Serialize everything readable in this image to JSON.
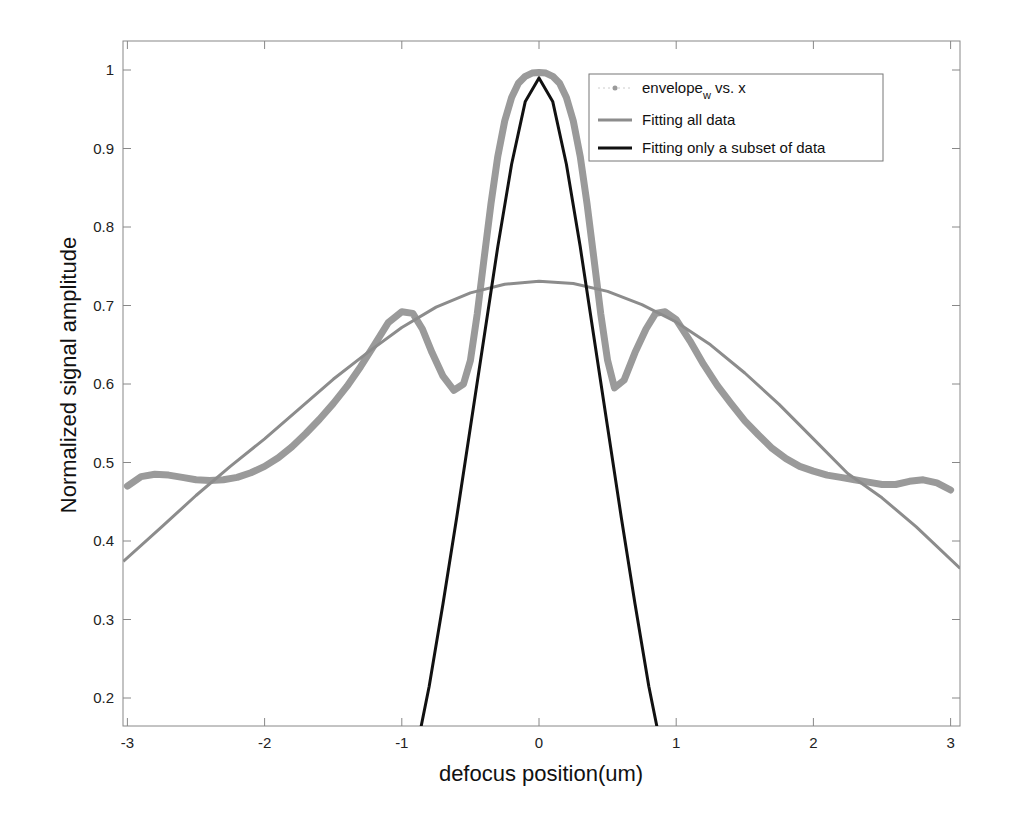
{
  "chart_data": {
    "type": "line",
    "title": "",
    "xlabel": "defocus position(um)",
    "ylabel": "Normalized signal amplitude",
    "xlim": [
      -3.03,
      3.07
    ],
    "ylim": [
      0.163,
      1.036
    ],
    "xticks": [
      -3,
      -2,
      -1,
      0,
      1,
      2,
      3
    ],
    "xtick_labels": [
      "-3",
      "-2",
      "-1",
      "0",
      "1",
      "2",
      "3"
    ],
    "yticks": [
      0.2,
      0.3,
      0.4,
      0.5,
      0.6,
      0.7,
      0.8,
      0.9,
      1
    ],
    "ytick_labels": [
      "0.2",
      "0.3",
      "0.4",
      "0.5",
      "0.6",
      "0.7",
      "0.8",
      "0.9",
      "1"
    ],
    "grid": false,
    "legend_position": "upper right",
    "legend": [
      {
        "label": "envelope",
        "subscript": "w",
        "suffix": " vs. x",
        "style": "dots",
        "color": "#9a9a9a"
      },
      {
        "label": "Fitting all data",
        "style": "line",
        "color": "#8c8c8c"
      },
      {
        "label": "Fitting only a subset of data",
        "style": "line",
        "color": "#111111"
      }
    ],
    "series": [
      {
        "name": "envelope_w vs. x",
        "color": "#9a9a9a",
        "x": [
          -3.0,
          -2.9,
          -2.8,
          -2.7,
          -2.6,
          -2.5,
          -2.4,
          -2.3,
          -2.2,
          -2.1,
          -2.0,
          -1.9,
          -1.8,
          -1.7,
          -1.6,
          -1.5,
          -1.4,
          -1.3,
          -1.2,
          -1.1,
          -1.0,
          -0.92,
          -0.85,
          -0.78,
          -0.7,
          -0.62,
          -0.55,
          -0.5,
          -0.45,
          -0.4,
          -0.35,
          -0.3,
          -0.25,
          -0.2,
          -0.15,
          -0.1,
          -0.05,
          0.0,
          0.05,
          0.1,
          0.15,
          0.2,
          0.25,
          0.3,
          0.35,
          0.4,
          0.45,
          0.5,
          0.55,
          0.62,
          0.7,
          0.78,
          0.85,
          0.92,
          1.0,
          1.1,
          1.2,
          1.3,
          1.4,
          1.5,
          1.6,
          1.7,
          1.8,
          1.9,
          2.0,
          2.1,
          2.2,
          2.3,
          2.4,
          2.5,
          2.6,
          2.7,
          2.8,
          2.9,
          3.0
        ],
        "y": [
          0.47,
          0.482,
          0.485,
          0.484,
          0.481,
          0.478,
          0.477,
          0.478,
          0.481,
          0.487,
          0.495,
          0.506,
          0.52,
          0.537,
          0.555,
          0.575,
          0.597,
          0.622,
          0.65,
          0.678,
          0.692,
          0.69,
          0.67,
          0.64,
          0.61,
          0.592,
          0.6,
          0.63,
          0.69,
          0.76,
          0.83,
          0.89,
          0.935,
          0.965,
          0.983,
          0.992,
          0.996,
          0.997,
          0.996,
          0.992,
          0.983,
          0.965,
          0.935,
          0.89,
          0.83,
          0.76,
          0.69,
          0.63,
          0.595,
          0.605,
          0.64,
          0.67,
          0.69,
          0.692,
          0.682,
          0.655,
          0.625,
          0.598,
          0.575,
          0.553,
          0.535,
          0.518,
          0.505,
          0.495,
          0.489,
          0.484,
          0.481,
          0.478,
          0.475,
          0.472,
          0.472,
          0.476,
          0.478,
          0.474,
          0.465
        ]
      },
      {
        "name": "Fitting all data",
        "color": "#8c8c8c",
        "x": [
          -3.03,
          -2.75,
          -2.5,
          -2.25,
          -2.0,
          -1.75,
          -1.5,
          -1.25,
          -1.0,
          -0.75,
          -0.5,
          -0.25,
          0.0,
          0.25,
          0.5,
          0.75,
          1.0,
          1.25,
          1.5,
          1.75,
          2.0,
          2.25,
          2.5,
          2.75,
          3.07
        ],
        "y": [
          0.374,
          0.418,
          0.458,
          0.495,
          0.53,
          0.568,
          0.606,
          0.64,
          0.672,
          0.698,
          0.716,
          0.727,
          0.731,
          0.728,
          0.718,
          0.701,
          0.679,
          0.65,
          0.614,
          0.574,
          0.53,
          0.486,
          0.455,
          0.418,
          0.365
        ]
      },
      {
        "name": "Fitting only a subset of data",
        "color": "#111111",
        "x": [
          -0.86,
          -0.8,
          -0.7,
          -0.6,
          -0.5,
          -0.4,
          -0.3,
          -0.2,
          -0.1,
          0.0,
          0.1,
          0.2,
          0.3,
          0.4,
          0.5,
          0.6,
          0.7,
          0.8,
          0.86
        ],
        "y": [
          0.163,
          0.215,
          0.32,
          0.43,
          0.545,
          0.66,
          0.775,
          0.88,
          0.96,
          0.99,
          0.96,
          0.88,
          0.775,
          0.66,
          0.545,
          0.43,
          0.32,
          0.215,
          0.163
        ]
      }
    ]
  }
}
